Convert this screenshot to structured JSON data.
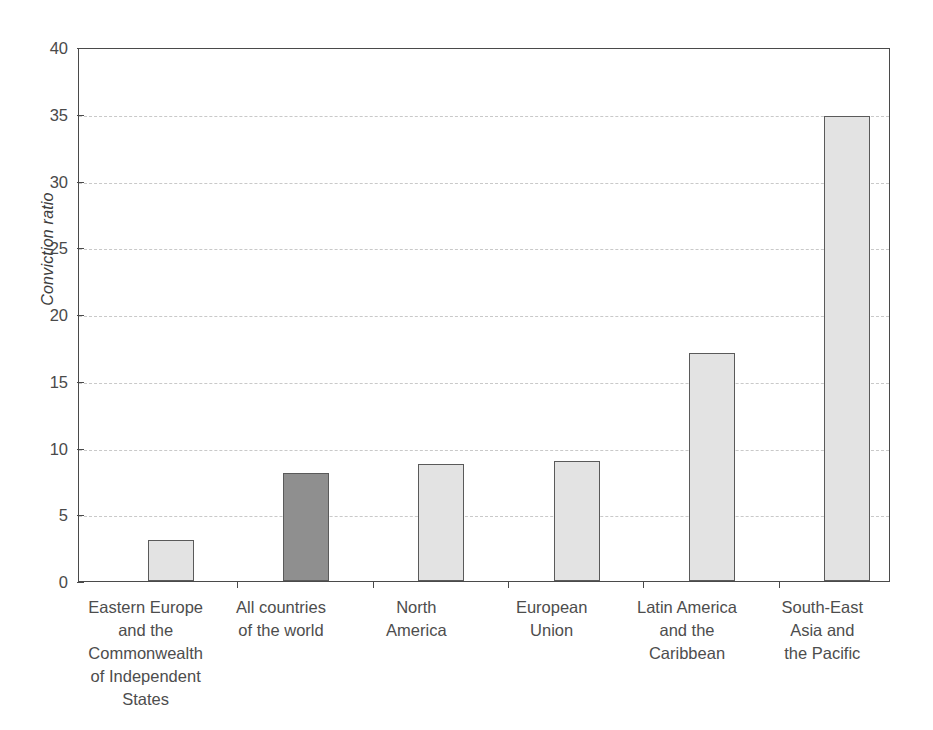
{
  "chart_data": {
    "type": "bar",
    "title": "",
    "subtitle": "",
    "xlabel": "",
    "ylabel": "Conviction ratio",
    "ylim": [
      0,
      40
    ],
    "ytick_step": 5,
    "yticks": [
      "40",
      "35",
      "30",
      "25",
      "20",
      "15",
      "10",
      "5",
      "0"
    ],
    "grid": true,
    "legend": "none",
    "categories": [
      "Eastern Europe and the Commonwealth of Independent States",
      "All countries of the world",
      "North America",
      "European Union",
      "Latin America and the Caribbean",
      "South-East Asia and the Pacific"
    ],
    "category_label_lines": [
      [
        "Eastern Europe",
        "and the",
        "Commonwealth",
        "of Independent",
        "States"
      ],
      [
        "All countries",
        "of the world"
      ],
      [
        "North",
        "America"
      ],
      [
        "European",
        "Union"
      ],
      [
        "Latin America",
        "and the",
        "Caribbean"
      ],
      [
        "South-East",
        "Asia and",
        "the Pacific"
      ]
    ],
    "values": [
      3.1,
      8.1,
      8.8,
      9.0,
      17.1,
      34.8
    ],
    "bar_colors": [
      "#e3e3e3",
      "#8f8f8f",
      "#e3e3e3",
      "#e3e3e3",
      "#e3e3e3",
      "#e3e3e3"
    ],
    "bar_edge_color": "#5a5a5a",
    "highlight_index": 1,
    "axis_color": "#4a4a4a",
    "grid_color": "#c9c9c9",
    "background": "#ffffff"
  }
}
